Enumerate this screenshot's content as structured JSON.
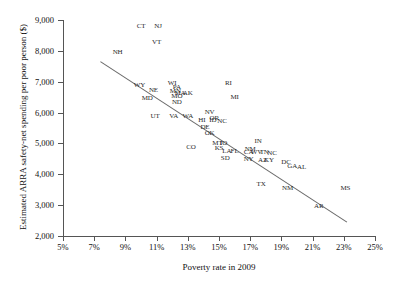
{
  "chart_data": {
    "type": "scatter",
    "title": "",
    "xlabel": "Poverty rate in 2009",
    "ylabel": "Estimated ARRA safety-net spending per poor person ($)",
    "xlim": [
      5,
      25
    ],
    "ylim": [
      2000,
      9000
    ],
    "xticks": [
      "5%",
      "7%",
      "9%",
      "11%",
      "13%",
      "15%",
      "17%",
      "19%",
      "21%",
      "23%",
      "25%"
    ],
    "xtick_values": [
      5,
      7,
      9,
      11,
      13,
      15,
      17,
      19,
      21,
      23,
      25
    ],
    "yticks": [
      "9,000",
      "8,000",
      "7,000",
      "6,000",
      "5,000",
      "4,000",
      "3,000",
      "2,000"
    ],
    "ytick_values": [
      9000,
      8000,
      7000,
      6000,
      5000,
      4000,
      3000,
      2000
    ],
    "grid": false,
    "legend": "none",
    "point_label_format": "state-abbreviation",
    "trendline": {
      "type": "linear",
      "x_start": 7.4,
      "y_start": 7650,
      "x_end": 23.2,
      "y_end": 2450
    },
    "points": [
      {
        "label": "NH",
        "x": 8.5,
        "y": 7960
      },
      {
        "label": "CT",
        "x": 10.0,
        "y": 8790
      },
      {
        "label": "NJ",
        "x": 11.1,
        "y": 8790
      },
      {
        "label": "VT",
        "x": 11.0,
        "y": 8300
      },
      {
        "label": "WY",
        "x": 9.9,
        "y": 6880
      },
      {
        "label": "NE",
        "x": 10.8,
        "y": 6730
      },
      {
        "label": "MD",
        "x": 10.4,
        "y": 6480
      },
      {
        "label": "UT",
        "x": 10.9,
        "y": 5880
      },
      {
        "label": "WI",
        "x": 12.0,
        "y": 6960
      },
      {
        "label": "PA",
        "x": 12.3,
        "y": 6840
      },
      {
        "label": "MN",
        "x": 12.2,
        "y": 6700
      },
      {
        "label": "MA",
        "x": 12.5,
        "y": 6650
      },
      {
        "label": "AK",
        "x": 13.0,
        "y": 6640
      },
      {
        "label": "MO",
        "x": 12.3,
        "y": 6530
      },
      {
        "label": "ND",
        "x": 12.3,
        "y": 6340
      },
      {
        "label": "RI",
        "x": 15.6,
        "y": 6960
      },
      {
        "label": "MI",
        "x": 16.0,
        "y": 6500
      },
      {
        "label": "VA",
        "x": 12.1,
        "y": 5890
      },
      {
        "label": "WA",
        "x": 13.0,
        "y": 5880
      },
      {
        "label": "NV",
        "x": 14.4,
        "y": 6020
      },
      {
        "label": "OR",
        "x": 14.7,
        "y": 5840
      },
      {
        "label": "HI",
        "x": 13.9,
        "y": 5760
      },
      {
        "label": "ID",
        "x": 14.6,
        "y": 5760
      },
      {
        "label": "NC",
        "x": 15.2,
        "y": 5740
      },
      {
        "label": "DE",
        "x": 14.1,
        "y": 5530
      },
      {
        "label": "OK",
        "x": 14.4,
        "y": 5330
      },
      {
        "label": "CO",
        "x": 13.2,
        "y": 4900
      },
      {
        "label": "MT",
        "x": 14.9,
        "y": 5030
      },
      {
        "label": "IO",
        "x": 15.3,
        "y": 5020
      },
      {
        "label": "KS",
        "x": 15.0,
        "y": 4860
      },
      {
        "label": "LA",
        "x": 15.5,
        "y": 4740
      },
      {
        "label": "FL",
        "x": 16.0,
        "y": 4740
      },
      {
        "label": "SD",
        "x": 15.4,
        "y": 4540
      },
      {
        "label": "IN",
        "x": 17.5,
        "y": 5080
      },
      {
        "label": "NM",
        "x": 17.0,
        "y": 4830
      },
      {
        "label": "CA",
        "x": 16.9,
        "y": 4730
      },
      {
        "label": "WV",
        "x": 17.4,
        "y": 4720
      },
      {
        "label": "TN",
        "x": 17.9,
        "y": 4720
      },
      {
        "label": "NC2",
        "x": 18.4,
        "y": 4700
      },
      {
        "label": "NY",
        "x": 16.9,
        "y": 4490
      },
      {
        "label": "AZ",
        "x": 17.8,
        "y": 4470
      },
      {
        "label": "KY",
        "x": 18.2,
        "y": 4450
      },
      {
        "label": "DC",
        "x": 19.3,
        "y": 4400
      },
      {
        "label": "GA",
        "x": 19.7,
        "y": 4280
      },
      {
        "label": "AL",
        "x": 20.3,
        "y": 4230
      },
      {
        "label": "TX",
        "x": 17.7,
        "y": 3700
      },
      {
        "label": "NM2",
        "x": 19.4,
        "y": 3560
      },
      {
        "label": "MS",
        "x": 23.1,
        "y": 3570
      },
      {
        "label": "AR",
        "x": 21.4,
        "y": 2960
      }
    ]
  }
}
